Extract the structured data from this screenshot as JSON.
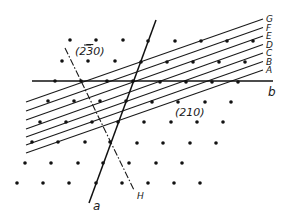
{
  "diagram": {
    "colors": {
      "ink": "#111111",
      "background": "#ffffff"
    },
    "lattice_points": [
      [
        70,
        40
      ],
      [
        96,
        40
      ],
      [
        123,
        40
      ],
      [
        148,
        41
      ],
      [
        175,
        41
      ],
      [
        201,
        41
      ],
      [
        227,
        41
      ],
      [
        253,
        41
      ],
      [
        62,
        61
      ],
      [
        88,
        61
      ],
      [
        115,
        61
      ],
      [
        141,
        62
      ],
      [
        167,
        62
      ],
      [
        193,
        62
      ],
      [
        219,
        62
      ],
      [
        245,
        62
      ],
      [
        55,
        81
      ],
      [
        81,
        81
      ],
      [
        107,
        81
      ],
      [
        133,
        81
      ],
      [
        160,
        82
      ],
      [
        186,
        82
      ],
      [
        212,
        82
      ],
      [
        238,
        82
      ],
      [
        48,
        101
      ],
      [
        74,
        101
      ],
      [
        100,
        101
      ],
      [
        126,
        101
      ],
      [
        152,
        102
      ],
      [
        178,
        102
      ],
      [
        205,
        102
      ],
      [
        231,
        102
      ],
      [
        40,
        122
      ],
      [
        66,
        122
      ],
      [
        92,
        122
      ],
      [
        118,
        122
      ],
      [
        144,
        122
      ],
      [
        171,
        122
      ],
      [
        197,
        122
      ],
      [
        223,
        122
      ],
      [
        32,
        142
      ],
      [
        58,
        142
      ],
      [
        85,
        142
      ],
      [
        110,
        142
      ],
      [
        137,
        143
      ],
      [
        163,
        143
      ],
      [
        190,
        143
      ],
      [
        216,
        143
      ],
      [
        25,
        163
      ],
      [
        51,
        163
      ],
      [
        78,
        163
      ],
      [
        103,
        163
      ],
      [
        129,
        163
      ],
      [
        156,
        163
      ],
      [
        182,
        163
      ],
      [
        17,
        183
      ],
      [
        43,
        183
      ],
      [
        69,
        183
      ],
      [
        96,
        183
      ],
      [
        122,
        183
      ],
      [
        148,
        183
      ],
      [
        174,
        183
      ],
      [
        200,
        183
      ]
    ],
    "plane_lines": [
      {
        "label": "A",
        "x1": 26,
        "y1": 153,
        "x2": 263,
        "y2": 70
      },
      {
        "label": "B",
        "x1": 26,
        "y1": 145,
        "x2": 263,
        "y2": 61.5
      },
      {
        "label": "C",
        "x1": 26,
        "y1": 137,
        "x2": 263,
        "y2": 53
      },
      {
        "label": "D",
        "x1": 26,
        "y1": 129,
        "x2": 263,
        "y2": 44.5
      },
      {
        "label": "E",
        "x1": 26,
        "y1": 120,
        "x2": 263,
        "y2": 36
      },
      {
        "label": "F",
        "x1": 26,
        "y1": 111,
        "x2": 263,
        "y2": 27.5
      },
      {
        "label": "G",
        "x1": 26,
        "y1": 102,
        "x2": 263,
        "y2": 19
      }
    ],
    "axis_a": {
      "label": "a",
      "x1": 156,
      "y1": 20,
      "x2": 89,
      "y2": 203,
      "label_x": 93,
      "label_y": 210
    },
    "axis_b": {
      "label": "b",
      "x1": 32,
      "y1": 81,
      "x2": 273,
      "y2": 81,
      "label_x": 268,
      "label_y": 96
    },
    "line_H": {
      "label": "H",
      "x1": 65,
      "y1": 48,
      "x2": 134,
      "y2": 190,
      "label_x": 137,
      "label_y": 199
    },
    "plane_label_210": {
      "text": "(210)",
      "x": 175,
      "y": 116
    },
    "plane_label_230": {
      "text_before": "(2",
      "text_bar": "3",
      "text_after": "0)",
      "x": 75,
      "y": 55
    }
  }
}
